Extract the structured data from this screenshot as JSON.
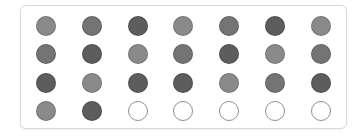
{
  "grid": {
    "rows": 4,
    "columns": 7,
    "filled_count": 23,
    "empty_count": 5,
    "total": 28
  },
  "colors": {
    "light": "#8a8a8a",
    "mid": "#747474",
    "dark": "#5d5d5d",
    "empty_fill": "#ffffff",
    "empty_stroke": "#8f8f8f"
  },
  "dots": [
    [
      "light",
      "mid",
      "dark",
      "light",
      "mid",
      "dark",
      "light"
    ],
    [
      "mid",
      "dark",
      "light",
      "mid",
      "dark",
      "light",
      "mid"
    ],
    [
      "dark",
      "light",
      "dark",
      "dark",
      "light",
      "mid",
      "dark"
    ],
    [
      "light",
      "dark",
      "empty",
      "empty",
      "empty",
      "empty",
      "empty"
    ]
  ]
}
